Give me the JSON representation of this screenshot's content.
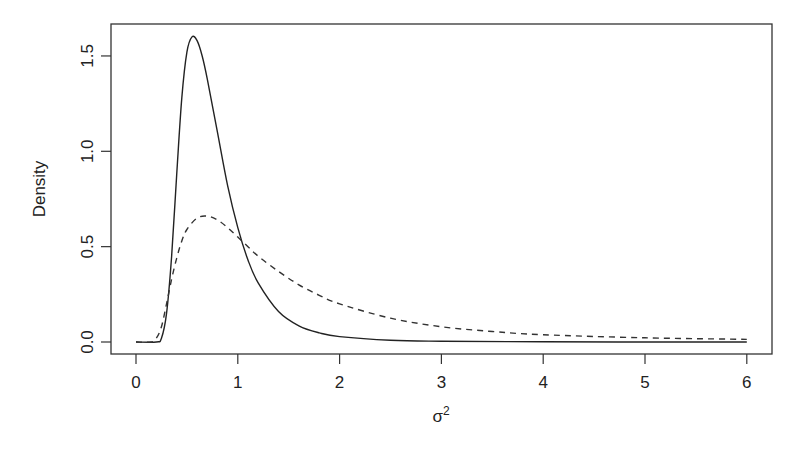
{
  "chart_data": {
    "type": "line",
    "title": "",
    "xlabel": "σ²",
    "xlabel_base": "σ",
    "xlabel_sup": "2",
    "ylabel": "Density",
    "xlim": [
      0,
      6
    ],
    "ylim": [
      0,
      1.6
    ],
    "x_ticks": [
      0,
      1,
      2,
      3,
      4,
      5,
      6
    ],
    "x_tick_labels": [
      "0",
      "1",
      "2",
      "3",
      "4",
      "5",
      "6"
    ],
    "y_ticks": [
      0.0,
      0.5,
      1.0,
      1.5
    ],
    "y_tick_labels": [
      "0.0",
      "0.5",
      "1.0",
      "1.5"
    ],
    "grid": false,
    "legend": null,
    "series": [
      {
        "name": "solid",
        "style": "solid",
        "color": "#222222",
        "x": [
          0.0,
          0.2,
          0.25,
          0.3,
          0.35,
          0.4,
          0.45,
          0.5,
          0.55,
          0.6,
          0.65,
          0.7,
          0.8,
          0.9,
          1.0,
          1.1,
          1.2,
          1.4,
          1.6,
          1.8,
          2.0,
          2.5,
          3.0,
          4.0,
          5.0,
          6.0
        ],
        "y": [
          0.0,
          0.0,
          0.02,
          0.15,
          0.45,
          0.88,
          1.28,
          1.52,
          1.6,
          1.58,
          1.5,
          1.38,
          1.1,
          0.82,
          0.6,
          0.43,
          0.31,
          0.16,
          0.085,
          0.048,
          0.028,
          0.009,
          0.004,
          0.001,
          0.0,
          0.0
        ]
      },
      {
        "name": "dashed",
        "style": "dashed",
        "color": "#333333",
        "x": [
          0.0,
          0.15,
          0.2,
          0.25,
          0.3,
          0.35,
          0.4,
          0.45,
          0.5,
          0.6,
          0.7,
          0.8,
          0.9,
          1.0,
          1.1,
          1.2,
          1.4,
          1.6,
          1.8,
          2.0,
          2.5,
          3.0,
          3.5,
          4.0,
          5.0,
          6.0
        ],
        "y": [
          0.0,
          0.0,
          0.02,
          0.08,
          0.2,
          0.33,
          0.44,
          0.53,
          0.59,
          0.65,
          0.66,
          0.64,
          0.6,
          0.55,
          0.5,
          0.45,
          0.37,
          0.3,
          0.245,
          0.2,
          0.125,
          0.08,
          0.055,
          0.038,
          0.022,
          0.014
        ]
      }
    ]
  }
}
